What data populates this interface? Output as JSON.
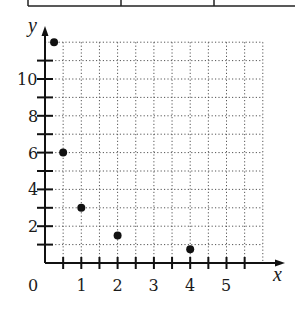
{
  "chart_data": {
    "type": "scatter",
    "title": "",
    "xlabel": "x",
    "ylabel": "y",
    "xlim": [
      0,
      6
    ],
    "ylim": [
      0,
      12
    ],
    "grid": true,
    "grid_style": "dotted",
    "x_ticks": [
      0.5,
      1,
      1.5,
      2,
      2.5,
      3,
      3.5,
      4,
      4.5,
      5,
      5.5
    ],
    "x_tick_labels": [
      "0",
      "1",
      "2",
      "3",
      "4",
      "5"
    ],
    "y_ticks": [
      1,
      2,
      3,
      4,
      5,
      6,
      7,
      8,
      9,
      10,
      11
    ],
    "y_tick_labels": [
      "2",
      "4",
      "6",
      "8",
      "10"
    ],
    "series": [
      {
        "name": "points",
        "x": [
          0.25,
          0.5,
          1,
          2,
          4
        ],
        "y": [
          12,
          6,
          3,
          1.5,
          0.75
        ]
      }
    ],
    "legend": null
  },
  "labels": {
    "x_axis": "x",
    "y_axis": "y",
    "origin": "0",
    "x_tick_1": "1",
    "x_tick_2": "2",
    "x_tick_3": "3",
    "x_tick_4": "4",
    "x_tick_5": "5",
    "y_tick_2": "2",
    "y_tick_4": "4",
    "y_tick_6": "6",
    "y_tick_8": "8",
    "y_tick_10": "10"
  }
}
